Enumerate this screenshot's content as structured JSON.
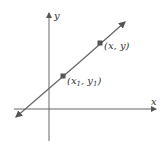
{
  "diagram": {
    "axes": {
      "x_label": "x",
      "y_label": "y"
    },
    "points": [
      {
        "label_pre": "(x",
        "sub1": "1",
        "label_mid": ", y",
        "sub2": "1",
        "label_post": ")",
        "name": "point-x1-y1"
      },
      {
        "label": "(x, y)",
        "name": "point-x-y"
      }
    ],
    "colors": {
      "axis": "#555555",
      "line": "#666666",
      "point": "#555555",
      "text": "#333333"
    }
  }
}
